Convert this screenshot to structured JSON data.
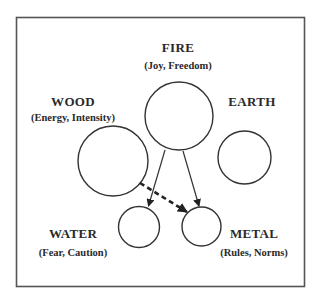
{
  "diagram": {
    "nodes": [
      {
        "id": "fire",
        "label": "FIRE",
        "subtitle": "(Joy, Freedom)"
      },
      {
        "id": "wood",
        "label": "WOOD",
        "subtitle": "(Energy, Intensity)"
      },
      {
        "id": "earth",
        "label": "EARTH",
        "subtitle": ""
      },
      {
        "id": "water",
        "label": "WATER",
        "subtitle": "(Fear, Caution)"
      },
      {
        "id": "metal",
        "label": "METAL",
        "subtitle": "(Rules, Norms)"
      }
    ],
    "edges": [
      {
        "from": "fire",
        "to": "water",
        "style": "solid"
      },
      {
        "from": "fire",
        "to": "metal",
        "style": "solid"
      },
      {
        "from": "wood",
        "to": "metal",
        "style": "dashed"
      }
    ]
  }
}
